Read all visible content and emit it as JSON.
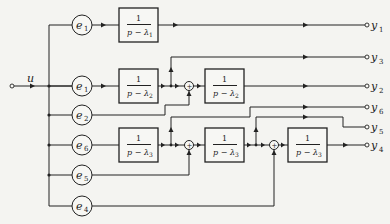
{
  "diagram": {
    "type": "block-diagram",
    "input": {
      "label": "u"
    },
    "gains": [
      {
        "id": "g1a",
        "label": "e",
        "sub": "1"
      },
      {
        "id": "g1b",
        "label": "e",
        "sub": "1"
      },
      {
        "id": "g2",
        "label": "e",
        "sub": "2"
      },
      {
        "id": "g6",
        "label": "e",
        "sub": "6"
      },
      {
        "id": "g5",
        "label": "e",
        "sub": "5"
      },
      {
        "id": "g4",
        "label": "e",
        "sub": "4"
      }
    ],
    "blocks": [
      {
        "id": "b1",
        "num": "1",
        "den": "p − λ",
        "sub": "1"
      },
      {
        "id": "b2",
        "num": "1",
        "den": "p − λ",
        "sub": "2"
      },
      {
        "id": "b3",
        "num": "1",
        "den": "p − λ",
        "sub": "2"
      },
      {
        "id": "b4",
        "num": "1",
        "den": "p − λ",
        "sub": "3"
      },
      {
        "id": "b5",
        "num": "1",
        "den": "p − λ",
        "sub": "3"
      },
      {
        "id": "b6",
        "num": "1",
        "den": "p − λ",
        "sub": "3"
      }
    ],
    "summers": [
      {
        "id": "s1",
        "label": "+"
      },
      {
        "id": "s2",
        "label": "+"
      },
      {
        "id": "s3",
        "label": "+"
      }
    ],
    "outputs": [
      {
        "id": "o1",
        "label": "y",
        "sub": "1"
      },
      {
        "id": "o3",
        "label": "y",
        "sub": "3"
      },
      {
        "id": "o2",
        "label": "y",
        "sub": "2"
      },
      {
        "id": "o6",
        "label": "y",
        "sub": "6"
      },
      {
        "id": "o5",
        "label": "y",
        "sub": "5"
      },
      {
        "id": "o4",
        "label": "y",
        "sub": "4"
      }
    ]
  }
}
